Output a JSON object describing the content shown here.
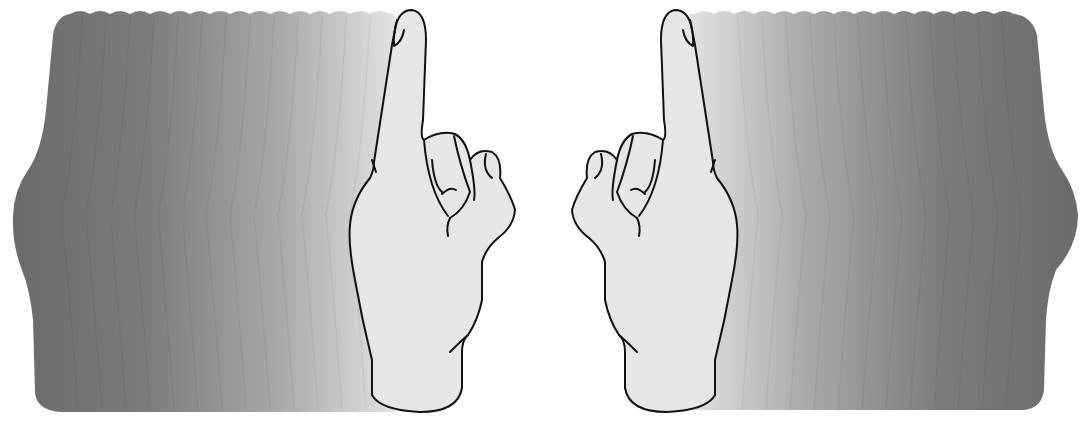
{
  "illustration": {
    "title": "",
    "subject": "two hands with index fingers raised, each with a motion trail of graded gray silhouettes",
    "background": "#ffffff",
    "colors": {
      "hand_fill": "#e6e6e6",
      "hand_outline": "#111111",
      "trail_darkest": "#6b6b6b",
      "trail_lightest": "#e3e3e3"
    },
    "left_hand": {
      "orientation": "palm-back, thumb on right",
      "trail_direction": "left"
    },
    "right_hand": {
      "orientation": "mirrored, thumb on left",
      "trail_direction": "right"
    },
    "trail_steps": 14
  }
}
